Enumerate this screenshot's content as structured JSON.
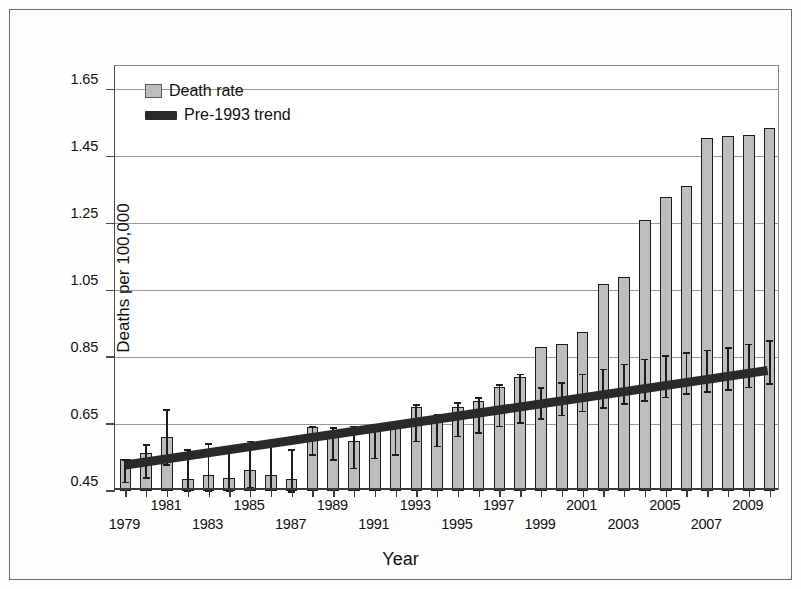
{
  "chart_data": {
    "type": "bar",
    "title": "",
    "xlabel": "Year",
    "ylabel": "Deaths per 100,000",
    "ylim": [
      0.45,
      1.72
    ],
    "yticks": [
      0.45,
      0.65,
      0.85,
      1.05,
      1.25,
      1.45,
      1.65
    ],
    "ytick_labels": [
      "0.45",
      "0.65",
      "0.85",
      "1.05",
      "1.25",
      "1.45",
      "1.65"
    ],
    "grid": true,
    "legend_position": "top-left",
    "legend": [
      "Death rate",
      "Pre-1993 trend"
    ],
    "categories": [
      1979,
      1980,
      1981,
      1982,
      1983,
      1984,
      1985,
      1986,
      1987,
      1988,
      1989,
      1990,
      1991,
      1992,
      1993,
      1994,
      1995,
      1996,
      1997,
      1998,
      1999,
      2000,
      2001,
      2002,
      2003,
      2004,
      2005,
      2006,
      2007,
      2008,
      2009,
      2010
    ],
    "xtick_labels": [
      "1979",
      "1981",
      "1983",
      "1985",
      "1987",
      "1989",
      "1991",
      "1993",
      "1995",
      "1997",
      "1999",
      "2001",
      "2003",
      "2005",
      "2007",
      "2009"
    ],
    "series": [
      {
        "name": "Death rate",
        "values": [
          0.545,
          0.562,
          0.605,
          0.488,
          0.497,
          0.492,
          0.51,
          0.5,
          0.487,
          0.552,
          0.575,
          0.548,
          0.574,
          0.582,
          0.624,
          0.6,
          0.632,
          0.642,
          0.658,
          0.668,
          0.7,
          0.708,
          0.745,
          0.752,
          0.78,
          0.805,
          0.828,
          0.843,
          0.858,
          0.882,
          0.912,
          0.93
        ],
        "err_low": [
          0.475,
          0.492,
          0.532,
          0.452,
          0.453,
          0.452,
          0.462,
          0.455,
          0.45,
          0.5,
          0.518,
          0.497,
          0.522,
          0.53,
          0.568,
          0.548,
          0.578,
          0.59,
          0.604,
          0.614,
          0.645,
          0.652,
          0.69,
          0.696,
          0.724,
          0.748,
          0.77,
          0.786,
          0.8,
          0.824,
          0.852,
          0.872
        ],
        "err_high": [
          0.545,
          0.578,
          0.672,
          0.58,
          0.592,
          0.592,
          0.604,
          0.592,
          0.58,
          0.645,
          0.648,
          0.645,
          0.648,
          0.652,
          0.706,
          0.68,
          0.712,
          0.722,
          0.74,
          0.752,
          0.786,
          0.794,
          0.832,
          0.84,
          0.868,
          0.894,
          0.918,
          0.934,
          0.95,
          0.974,
          1.004,
          1.022
        ]
      },
      {
        "name": "Bar heights (visual)",
        "values": [
          0.545,
          0.562,
          0.605,
          0.488,
          0.497,
          0.492,
          0.51,
          0.5,
          0.487,
          0.552,
          0.575,
          0.548,
          0.574,
          0.582,
          0.624,
          0.6,
          0.632,
          0.642,
          0.658,
          0.668,
          0.7,
          0.708,
          0.745,
          0.752,
          0.78,
          0.805,
          0.828,
          0.843,
          0.858,
          0.882,
          0.912,
          0.93
        ]
      }
    ],
    "bar_tops": [
      0.545,
      0.565,
      0.61,
      0.485,
      0.497,
      0.49,
      0.513,
      0.498,
      0.485,
      0.64,
      0.62,
      0.6,
      0.64,
      0.65,
      0.7,
      0.665,
      0.7,
      0.72,
      0.76,
      0.79,
      0.88,
      0.89,
      0.925,
      1.07,
      1.09,
      1.26,
      1.33,
      1.36,
      1.505,
      1.51,
      1.515,
      1.535
    ],
    "bar_values_true": [
      0.545,
      0.565,
      0.61,
      0.485,
      0.497,
      0.49,
      0.513,
      0.498,
      0.485,
      0.64,
      0.62,
      0.6,
      0.64,
      0.65,
      0.7,
      0.665,
      0.7,
      0.72,
      0.76,
      0.79,
      0.88,
      0.89,
      0.925,
      1.07,
      1.09,
      1.26,
      1.33,
      1.36,
      1.505,
      1.51,
      1.515,
      1.535
    ],
    "err_upper": [
      0.545,
      0.59,
      0.695,
      0.575,
      0.592,
      0.585,
      0.6,
      0.59,
      0.575,
      0.645,
      0.64,
      0.645,
      0.65,
      0.655,
      0.71,
      0.68,
      0.715,
      0.73,
      0.77,
      0.8,
      0.76,
      0.775,
      0.8,
      0.815,
      0.83,
      0.845,
      0.855,
      0.865,
      0.872,
      0.88,
      0.89,
      0.9
    ],
    "err_lower": [
      0.478,
      0.492,
      0.53,
      0.452,
      0.453,
      0.452,
      0.463,
      0.455,
      0.45,
      0.56,
      0.545,
      0.52,
      0.55,
      0.56,
      0.6,
      0.585,
      0.615,
      0.625,
      0.645,
      0.655,
      0.668,
      0.678,
      0.69,
      0.7,
      0.712,
      0.722,
      0.732,
      0.742,
      0.748,
      0.755,
      0.762,
      0.772
    ],
    "trend_line": {
      "name": "Pre-1993 trend",
      "start_year": 1979,
      "end_year": 2010,
      "start_value": 0.525,
      "end_value": 0.808,
      "color": "#2a2a2a"
    }
  },
  "colors": {
    "bar_fill": "#bdbdbd",
    "bar_edge": "#1c1c1c",
    "trend": "#2a2a2a",
    "grid": "#9a9a9a",
    "axis": "#3a3a3a",
    "frame": "#6d6d6d",
    "text": "#111111"
  },
  "legend": {
    "items": [
      {
        "label": "Death rate",
        "swatch": "bar-swatch"
      },
      {
        "label": "Pre-1993 trend",
        "swatch": "trend-swatch"
      }
    ]
  },
  "axes": {
    "y_title": "Deaths per 100,000",
    "x_title": "Year"
  }
}
